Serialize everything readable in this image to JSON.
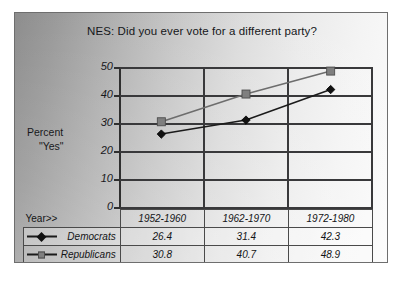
{
  "chart_data": {
    "type": "line",
    "title": "NES:  Did you ever  vote for a different party?",
    "xlabel": "Year>>",
    "ylabel": "Percent \"Yes\"",
    "ylabel_line1": "Percent",
    "ylabel_line2": "\"Yes\"",
    "categories": [
      "1952-1960",
      "1962-1970",
      "1972-1980"
    ],
    "series": [
      {
        "name": "Democrats",
        "values": [
          26.4,
          31.4,
          42.3
        ],
        "marker": "diamond",
        "color": "#111111"
      },
      {
        "name": "Republicans",
        "values": [
          30.8,
          40.7,
          48.9
        ],
        "marker": "square",
        "color": "#7f7f7f"
      }
    ],
    "ylim": [
      0,
      50
    ],
    "yticks": [
      0,
      10,
      20,
      30,
      40,
      50
    ],
    "ytick_labels": [
      "0",
      "10",
      "20",
      "30",
      "40",
      "50"
    ],
    "grid": true,
    "legend_position": "table-left-column"
  },
  "table": {
    "row_label_header": "Year>>",
    "columns": [
      "1952-1960",
      "1962-1970",
      "1972-1980"
    ],
    "rows": [
      {
        "label": "Democrats",
        "marker": "diamond-marker",
        "cells": [
          "26.4",
          "31.4",
          "42.3"
        ]
      },
      {
        "label": "Republicans",
        "marker": "square-marker",
        "cells": [
          "30.8",
          "40.7",
          "48.9"
        ]
      }
    ]
  },
  "colors": {
    "democrats": "#111111",
    "republicans": "#7f7f7f",
    "gridline": "#39393b",
    "frame_border": "#6e6e6e",
    "text": "#18191c"
  }
}
